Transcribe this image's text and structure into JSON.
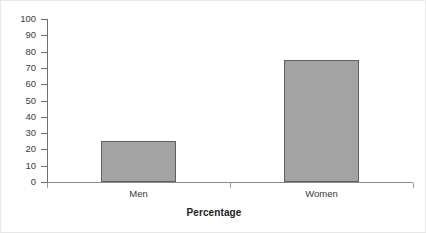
{
  "chart_data": {
    "type": "bar",
    "title": "",
    "subtitle": "",
    "xlabel": "Percentage",
    "ylabel": "",
    "categories": [
      "Men",
      "Women"
    ],
    "values": [
      25,
      75
    ],
    "series": [
      {
        "name": "Percentage",
        "values": [
          25,
          75
        ]
      }
    ],
    "ylim": [
      0,
      100
    ],
    "ytick_step": 10,
    "ytick_labels": [
      "100",
      "90",
      "80",
      "70",
      "60",
      "50",
      "40",
      "30",
      "20",
      "10",
      "0"
    ],
    "ytick_values": [
      100,
      90,
      80,
      70,
      60,
      50,
      40,
      30,
      20,
      10,
      0
    ],
    "grid": false,
    "legend": false,
    "legend_position": "none",
    "annotations": [],
    "colors": {
      "bar_fill": "#a3a3a3",
      "bar_edge": "#5e5e5e",
      "axis": "#6e6e6e",
      "baseline": "#8a8a8a",
      "text": "#3b3b3b",
      "title_text": "#222222",
      "background": "#ffffff",
      "frame_border": "#e8e8e8"
    }
  }
}
